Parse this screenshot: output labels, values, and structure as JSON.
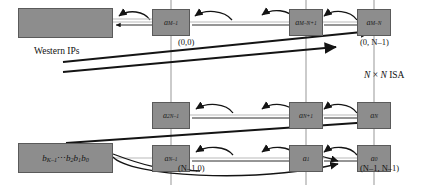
{
  "figure": {
    "type": "diagram",
    "title_label": "N × N  ISA",
    "western_ips_label": "Western IPs",
    "b_register_label": "b_{K-1}⋯ b_2 b_1 b_0",
    "rows": 3,
    "cols": 3
  },
  "cells": {
    "top": [
      {
        "name": "a-M-minus-1",
        "base": "a",
        "sub": "M–1"
      },
      {
        "name": "a-M-minus-N-plus-1",
        "base": "a",
        "sub": "M–N+1"
      },
      {
        "name": "a-M-minus-N",
        "base": "a",
        "sub": "M–N"
      }
    ],
    "middle": [
      {
        "name": "a-2N-minus-1",
        "base": "a",
        "sub": "2N–1"
      },
      {
        "name": "a-N-plus-1",
        "base": "a",
        "sub": "N+1"
      },
      {
        "name": "a-N",
        "base": "a",
        "sub": "N"
      }
    ],
    "bottom": [
      {
        "name": "a-N-minus-1",
        "base": "a",
        "sub": "N–1"
      },
      {
        "name": "a-1",
        "base": "a",
        "sub": "1"
      },
      {
        "name": "a-0",
        "base": "a",
        "sub": "0"
      }
    ]
  },
  "coordinates": {
    "top_left": "(0,0)",
    "top_right": "(0, N–1)",
    "bottom_left": "(N–1,0)",
    "bottom_right": "(N–1, N–1)"
  },
  "blocks": {
    "western_ips": {
      "caption": "Western IPs"
    },
    "b_register": {
      "prefix": "b",
      "prefix_sub": "K–1",
      "dots": "⋯",
      "b2": "b",
      "b2_sub": "2",
      "b1": "b",
      "b1_sub": "1",
      "b0": "b",
      "b0_sub": "0"
    }
  },
  "annotations": {
    "isa_n": "N",
    "isa_times": "×",
    "isa_n2": "N",
    "isa_text": "ISA"
  },
  "colors": {
    "cell_fill": "#8d8d8d",
    "cell_stroke": "#5a5a5a",
    "light_wire": "#b9b9b9",
    "dark_wire": "#1a1a1a",
    "text": "#111111",
    "background": "#ffffff"
  }
}
